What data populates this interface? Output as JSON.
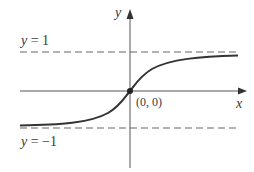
{
  "diagram": {
    "labels": {
      "y_axis": "y",
      "x_axis": "x",
      "asymptote_top_var": "y",
      "asymptote_top_eq": " = 1",
      "asymptote_bottom_var": "y",
      "asymptote_bottom_eq": " = −1",
      "origin": "(0, 0)"
    },
    "colors": {
      "axis": "#555555",
      "curve": "#333333",
      "dashed": "#666666",
      "text": "#3a3a3a"
    },
    "asymptotes": [
      1,
      -1
    ],
    "point": {
      "x": 0,
      "y": 0
    }
  }
}
